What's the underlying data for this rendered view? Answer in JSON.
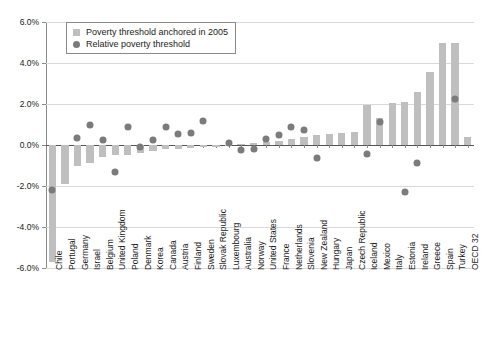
{
  "legend": {
    "items": [
      {
        "label": "Poverty threshold anchored in 2005",
        "marker": "bar-swatch-icon",
        "color": "#bfbfbf"
      },
      {
        "label": "Relative poverty threshold",
        "marker": "dot-swatch-icon",
        "color": "#7b7b7b"
      }
    ]
  },
  "axis": {
    "y_ticks": [
      "6.0%",
      "4.0%",
      "2.0%",
      "0.0%",
      "-2.0%",
      "-4.0%",
      "-6.0%"
    ]
  },
  "chart_data": {
    "type": "bar",
    "title": "",
    "subtitle": "",
    "xlabel": "",
    "ylabel": "",
    "ylim": [
      -6,
      6
    ],
    "ytick_values": [
      6,
      4,
      2,
      0,
      -2,
      -4,
      -6
    ],
    "grid": true,
    "legend_position": "top-left",
    "categories": [
      "Chile",
      "Portugal",
      "Germany",
      "Israel",
      "Belgium",
      "United Kingdom",
      "Poland",
      "Denmark",
      "Korea",
      "Canada",
      "Austria",
      "Finland",
      "Sweden",
      "Slovak Republic",
      "Luxembourg",
      "Australia",
      "Norway",
      "United States",
      "France",
      "Netherlands",
      "Slovenia",
      "New Zealand",
      "Hungary",
      "Japan",
      "Czech Republic",
      "Iceland",
      "Mexico",
      "Italy",
      "Estonia",
      "Ireland",
      "Greece",
      "Spain",
      "Turkey",
      "OECD 32"
    ],
    "series": [
      {
        "name": "Poverty threshold anchored in 2005",
        "type": "bar",
        "color": "#bfbfbf",
        "values": [
          -5.7,
          -1.9,
          -1.0,
          -0.9,
          -0.6,
          -0.5,
          -0.5,
          -0.4,
          -0.3,
          -0.2,
          -0.2,
          -0.15,
          -0.1,
          -0.1,
          -0.05,
          0.05,
          0.1,
          0.15,
          0.2,
          0.3,
          0.4,
          0.5,
          0.55,
          0.6,
          0.65,
          1.95,
          1.3,
          2.05,
          2.1,
          2.6,
          3.55,
          5.0,
          5.0,
          0.4
        ]
      },
      {
        "name": "Relative poverty threshold",
        "type": "scatter",
        "color": "#7b7b7b",
        "values": [
          -2.2,
          null,
          0.35,
          1.0,
          0.25,
          -1.3,
          0.9,
          -0.1,
          0.25,
          0.9,
          0.55,
          0.6,
          1.15,
          null,
          0.1,
          -0.25,
          -0.2,
          0.3,
          0.5,
          0.9,
          0.75,
          -0.65,
          null,
          null,
          null,
          -0.45,
          1.1,
          null,
          -2.3,
          -0.9,
          null,
          null,
          2.25,
          null
        ]
      }
    ]
  }
}
